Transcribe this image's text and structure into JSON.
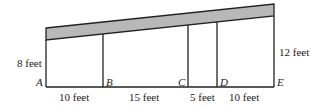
{
  "diagram": {
    "type": "roof-cross-section",
    "points": [
      "A",
      "B",
      "C",
      "D",
      "E"
    ],
    "heights": {
      "left": "8 feet",
      "right": "12 feet"
    },
    "segments": [
      "10 feet",
      "15 feet",
      "5 feet",
      "10 feet"
    ],
    "colors": {
      "roof": "#b8b8b8",
      "line": "#222222"
    }
  }
}
